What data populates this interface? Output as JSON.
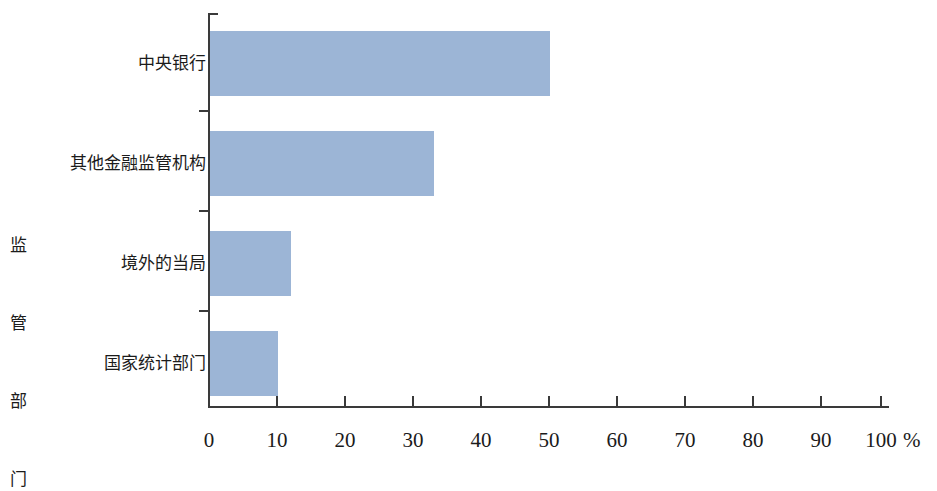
{
  "chart_data": {
    "type": "bar",
    "orientation": "horizontal",
    "title": "",
    "subtitle": "",
    "xlabel": "%",
    "ylabel": "监管部门",
    "categories": [
      "中央银行",
      "其他金融监管机构",
      "境外的当局",
      "国家统计部门"
    ],
    "values": [
      50,
      33,
      12,
      10
    ],
    "series": [
      {
        "name": "",
        "values": [
          50,
          33,
          12,
          10
        ]
      }
    ],
    "xlim": [
      0,
      100
    ],
    "xticks": [
      0,
      10,
      20,
      30,
      40,
      50,
      60,
      70,
      80,
      90,
      100
    ],
    "xtick_labels": [
      "0",
      "10",
      "20",
      "30",
      "40",
      "50",
      "60",
      "70",
      "80",
      "90",
      "100"
    ],
    "grid": false,
    "legend": false,
    "legend_position": "none",
    "bar_color": "#9cb5d6",
    "axis_color": "#3a3a3a",
    "background_color": "#ffffff",
    "annotations": []
  },
  "axis": {
    "y_title_chars": [
      "监",
      "管",
      "部",
      "门"
    ],
    "x_unit_label": "%"
  }
}
